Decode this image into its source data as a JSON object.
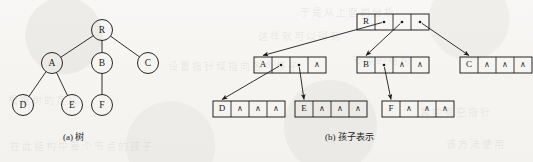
{
  "figure": {
    "background_color": "#f6f5f3",
    "ink_color": "#1a1a1a",
    "captions": {
      "left": "(a) 树",
      "right": "(b) 孩子表示"
    }
  },
  "ghost_text": [
    {
      "text": "于是从上面的分析",
      "x": 300,
      "y": 4
    },
    {
      "text": "这样就可以得到",
      "x": 258,
      "y": 28
    },
    {
      "text": "节点的结构",
      "x": 352,
      "y": 52
    },
    {
      "text": "设置指针域指向各个孩子",
      "x": 168,
      "y": 58
    },
    {
      "text": "根据树的定义",
      "x": 8,
      "y": 92
    },
    {
      "text": "在此结构中每个节点的孩子",
      "x": 10,
      "y": 138
    },
    {
      "text": "其中有空指针",
      "x": 420,
      "y": 104
    },
    {
      "text": "该方法使用",
      "x": 446,
      "y": 136
    }
  ],
  "tree": {
    "label": "tree-diagram",
    "nodes": [
      {
        "id": "R",
        "label": "R",
        "cx": 102,
        "cy": 30
      },
      {
        "id": "A",
        "label": "A",
        "cx": 52,
        "cy": 63
      },
      {
        "id": "B",
        "label": "B",
        "cx": 102,
        "cy": 63
      },
      {
        "id": "C",
        "label": "C",
        "cx": 148,
        "cy": 63
      },
      {
        "id": "D",
        "label": "D",
        "cx": 23,
        "cy": 105
      },
      {
        "id": "E",
        "label": "E",
        "cx": 72,
        "cy": 105
      },
      {
        "id": "F",
        "label": "F",
        "cx": 102,
        "cy": 105
      }
    ],
    "radius": 10.5,
    "edges": [
      {
        "from": "R",
        "to": "A"
      },
      {
        "from": "R",
        "to": "B"
      },
      {
        "from": "R",
        "to": "C"
      },
      {
        "from": "A",
        "to": "D"
      },
      {
        "from": "A",
        "to": "E"
      },
      {
        "from": "B",
        "to": "F"
      }
    ]
  },
  "child_representation": {
    "label": "child-representation-diagram",
    "nil_glyph": "∧",
    "cell_width": 18,
    "cell_height": 16,
    "records": [
      {
        "id": "R",
        "data": "R",
        "x": 357,
        "y": 14,
        "cells": [
          "pointer",
          "pointer",
          "pointer"
        ]
      },
      {
        "id": "A",
        "data": "A",
        "x": 254,
        "y": 57,
        "cells": [
          "pointer",
          "pointer",
          "nil"
        ]
      },
      {
        "id": "B",
        "data": "B",
        "x": 357,
        "y": 57,
        "cells": [
          "pointer",
          "nil",
          "nil"
        ]
      },
      {
        "id": "C",
        "data": "C",
        "x": 460,
        "y": 57,
        "cells": [
          "nil",
          "nil",
          "nil"
        ]
      },
      {
        "id": "D",
        "data": "D",
        "x": 213,
        "y": 101,
        "cells": [
          "nil",
          "nil",
          "nil"
        ]
      },
      {
        "id": "E",
        "data": "E",
        "x": 295,
        "y": 101,
        "cells": [
          "nil",
          "nil",
          "nil"
        ]
      },
      {
        "id": "F",
        "data": "F",
        "x": 382,
        "y": 101,
        "cells": [
          "nil",
          "nil",
          "nil"
        ]
      }
    ],
    "links": [
      {
        "from": "R",
        "slot": 0,
        "to": "A"
      },
      {
        "from": "R",
        "slot": 1,
        "to": "B"
      },
      {
        "from": "R",
        "slot": 2,
        "to": "C"
      },
      {
        "from": "A",
        "slot": 0,
        "to": "D"
      },
      {
        "from": "A",
        "slot": 1,
        "to": "E"
      },
      {
        "from": "B",
        "slot": 0,
        "to": "F"
      }
    ]
  }
}
